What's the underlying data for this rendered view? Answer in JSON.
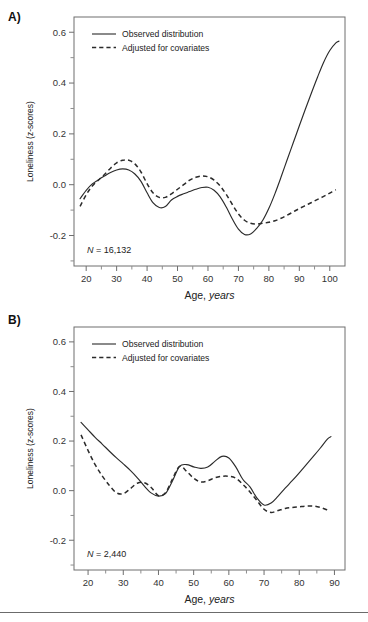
{
  "figure": {
    "background": "#ffffff",
    "line_color": "#2b2b2b",
    "axis_color": "#6e6e6e",
    "footer_rule": true
  },
  "panels": [
    {
      "key": "A",
      "label": "A)",
      "sample_size_prefix": "N",
      "sample_size_text": "= 16,132",
      "legend": [
        {
          "label": "Observed distribution",
          "style": "solid"
        },
        {
          "label": "Adjusted for covariates",
          "style": "dashed"
        }
      ]
    },
    {
      "key": "B",
      "label": "B)",
      "sample_size_prefix": "N",
      "sample_size_text": "= 2,440",
      "legend": [
        {
          "label": "Observed distribution",
          "style": "solid"
        },
        {
          "label": "Adjusted for covariates",
          "style": "dashed"
        }
      ]
    }
  ],
  "chart_data": [
    {
      "panel": "A",
      "type": "line",
      "title": "",
      "xlabel_plain": "Age,",
      "xlabel_italic": "years",
      "ylabel": "Loneliness (z-scores)",
      "xlim": [
        16,
        105
      ],
      "ylim": [
        -0.32,
        0.66
      ],
      "xticks": [
        20,
        30,
        40,
        50,
        60,
        70,
        80,
        90,
        100
      ],
      "xticks_minor": [
        25,
        35,
        45,
        55,
        65,
        75,
        85,
        95
      ],
      "yticks": [
        0.6,
        0.4,
        0.2,
        0.0,
        -0.2
      ],
      "ytick_labels": [
        "0.6",
        "0.4",
        "0.2",
        "0.0",
        "-0.2"
      ],
      "yticks_minor": [
        0.5,
        0.3,
        0.1,
        -0.1,
        -0.3
      ],
      "grid": false,
      "legend_position": "top-left",
      "annotation": "N = 16,132",
      "series": [
        {
          "name": "Observed distribution",
          "style": "solid",
          "x": [
            18,
            20,
            22,
            24,
            26,
            28,
            30,
            32,
            34,
            36,
            38,
            40,
            42,
            44,
            46,
            48,
            50,
            52,
            54,
            56,
            58,
            60,
            62,
            64,
            66,
            68,
            70,
            72,
            74,
            76,
            78,
            80,
            82,
            84,
            86,
            88,
            90,
            92,
            94,
            96,
            98,
            100,
            102,
            103
          ],
          "y": [
            -0.055,
            -0.022,
            0.003,
            0.019,
            0.034,
            0.048,
            0.058,
            0.062,
            0.058,
            0.042,
            0.013,
            -0.032,
            -0.072,
            -0.09,
            -0.086,
            -0.06,
            -0.046,
            -0.036,
            -0.027,
            -0.018,
            -0.011,
            -0.01,
            -0.022,
            -0.048,
            -0.088,
            -0.135,
            -0.175,
            -0.196,
            -0.194,
            -0.172,
            -0.14,
            -0.093,
            -0.035,
            0.03,
            0.098,
            0.165,
            0.232,
            0.298,
            0.362,
            0.424,
            0.482,
            0.528,
            0.558,
            0.565
          ]
        },
        {
          "name": "Adjusted for covariates",
          "style": "dashed",
          "x": [
            18,
            20,
            22,
            24,
            26,
            28,
            30,
            32,
            34,
            36,
            38,
            40,
            42,
            44,
            46,
            48,
            50,
            52,
            54,
            56,
            58,
            60,
            62,
            64,
            66,
            68,
            70,
            72,
            74,
            76,
            78,
            80,
            82,
            84,
            86,
            88,
            90,
            92,
            94,
            96,
            98,
            100,
            102
          ],
          "y": [
            -0.085,
            -0.04,
            -0.005,
            0.018,
            0.04,
            0.065,
            0.086,
            0.096,
            0.096,
            0.082,
            0.05,
            0.004,
            -0.033,
            -0.05,
            -0.05,
            -0.036,
            -0.018,
            0.0,
            0.018,
            0.029,
            0.034,
            0.031,
            0.018,
            -0.005,
            -0.038,
            -0.078,
            -0.115,
            -0.14,
            -0.152,
            -0.155,
            -0.152,
            -0.148,
            -0.142,
            -0.132,
            -0.12,
            -0.107,
            -0.094,
            -0.082,
            -0.07,
            -0.058,
            -0.046,
            -0.033,
            -0.02
          ]
        }
      ]
    },
    {
      "panel": "B",
      "type": "line",
      "title": "",
      "xlabel_plain": "Age,",
      "xlabel_italic": "years",
      "ylabel": "Loneliness (z-scores)",
      "xlim": [
        16,
        93
      ],
      "ylim": [
        -0.32,
        0.66
      ],
      "xticks": [
        20,
        30,
        40,
        50,
        60,
        70,
        80,
        90
      ],
      "xticks_minor": [
        25,
        35,
        45,
        55,
        65,
        75,
        85
      ],
      "yticks": [
        0.6,
        0.4,
        0.2,
        0.0,
        -0.2
      ],
      "ytick_labels": [
        "0.6",
        "0.4",
        "0.2",
        "0.0",
        "-0.2"
      ],
      "yticks_minor": [
        0.5,
        0.3,
        0.1,
        -0.1,
        -0.3
      ],
      "grid": false,
      "legend_position": "top-left",
      "annotation": "N = 2,440",
      "series": [
        {
          "name": "Observed distribution",
          "style": "solid",
          "x": [
            18,
            20,
            22,
            24,
            26,
            28,
            30,
            32,
            34,
            36,
            38,
            40,
            42,
            44,
            46,
            48,
            50,
            52,
            54,
            56,
            58,
            60,
            62,
            64,
            66,
            68,
            70,
            72,
            74,
            76,
            78,
            80,
            82,
            84,
            86,
            88,
            89
          ],
          "y": [
            0.275,
            0.245,
            0.215,
            0.188,
            0.16,
            0.133,
            0.108,
            0.082,
            0.052,
            0.018,
            -0.01,
            -0.022,
            -0.012,
            0.04,
            0.098,
            0.105,
            0.096,
            0.09,
            0.095,
            0.118,
            0.138,
            0.132,
            0.095,
            0.045,
            0.015,
            -0.03,
            -0.058,
            -0.05,
            -0.022,
            0.01,
            0.04,
            0.072,
            0.105,
            0.138,
            0.172,
            0.208,
            0.218
          ]
        },
        {
          "name": "Adjusted for covariates",
          "style": "dashed",
          "x": [
            18,
            20,
            22,
            24,
            26,
            28,
            30,
            32,
            34,
            36,
            38,
            40,
            42,
            44,
            46,
            48,
            50,
            52,
            54,
            56,
            58,
            60,
            62,
            64,
            66,
            68,
            70,
            72,
            74,
            76,
            78,
            80,
            82,
            84,
            86,
            88
          ],
          "y": [
            0.225,
            0.162,
            0.105,
            0.06,
            0.022,
            -0.008,
            -0.012,
            0.008,
            0.03,
            0.032,
            0.012,
            -0.02,
            -0.008,
            0.048,
            0.098,
            0.078,
            0.05,
            0.035,
            0.04,
            0.052,
            0.058,
            0.058,
            0.05,
            0.025,
            -0.005,
            -0.04,
            -0.075,
            -0.088,
            -0.08,
            -0.072,
            -0.068,
            -0.065,
            -0.062,
            -0.062,
            -0.068,
            -0.078
          ]
        }
      ]
    }
  ]
}
